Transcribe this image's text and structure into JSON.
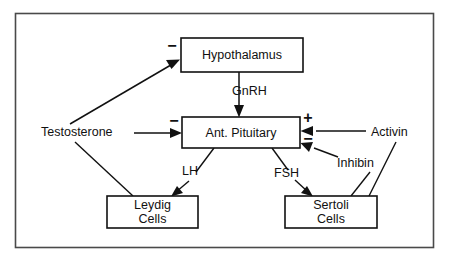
{
  "figure": {
    "frame_color": "#4a4a4a",
    "line_color": "#111111",
    "background_color": "#ffffff"
  },
  "nodes": {
    "hypothalamus": {
      "label": "Hypothalamus"
    },
    "anterior_pituitary": {
      "label": "Ant. Pituitary"
    },
    "leydig": {
      "line1": "Leydig",
      "line2": "Cells"
    },
    "sertoli": {
      "line1": "Sertoli",
      "line2": "Cells"
    }
  },
  "free_labels": {
    "testosterone": "Testosterone",
    "activin": "Activin",
    "inhibin": "Inhibin"
  },
  "edge_labels": {
    "gnrh": "GnRH",
    "lh": "LH",
    "fsh": "FSH"
  },
  "signs": {
    "testosterone_to_hypothalamus": "−",
    "testosterone_to_pituitary": "−",
    "activin_to_pituitary": "+",
    "inhibin_to_pituitary": "−"
  }
}
